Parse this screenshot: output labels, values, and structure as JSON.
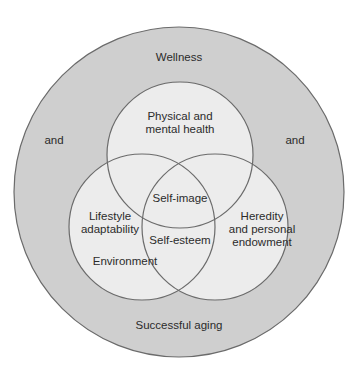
{
  "diagram": {
    "outer_circle": {
      "label_top": "Wellness",
      "label_bottom": "Successful aging",
      "label_left": "and",
      "label_right": "and"
    },
    "circles": {
      "top": {
        "label_line1": "Physical and",
        "label_line2": "mental health"
      },
      "left": {
        "label_line1": "Lifestyle",
        "label_line2": "adaptability",
        "label_extra": "Environment"
      },
      "right": {
        "label_line1": "Heredity",
        "label_line2": "and personal",
        "label_line3": "endowment"
      }
    },
    "overlaps": {
      "center_upper": "Self-image",
      "center_lower": "Self-esteem"
    }
  },
  "colors": {
    "outer_fill": "#cfcfcf",
    "inner_fill": "#ececec",
    "stroke": "#6b6b6b",
    "text": "#2b2b2b"
  }
}
